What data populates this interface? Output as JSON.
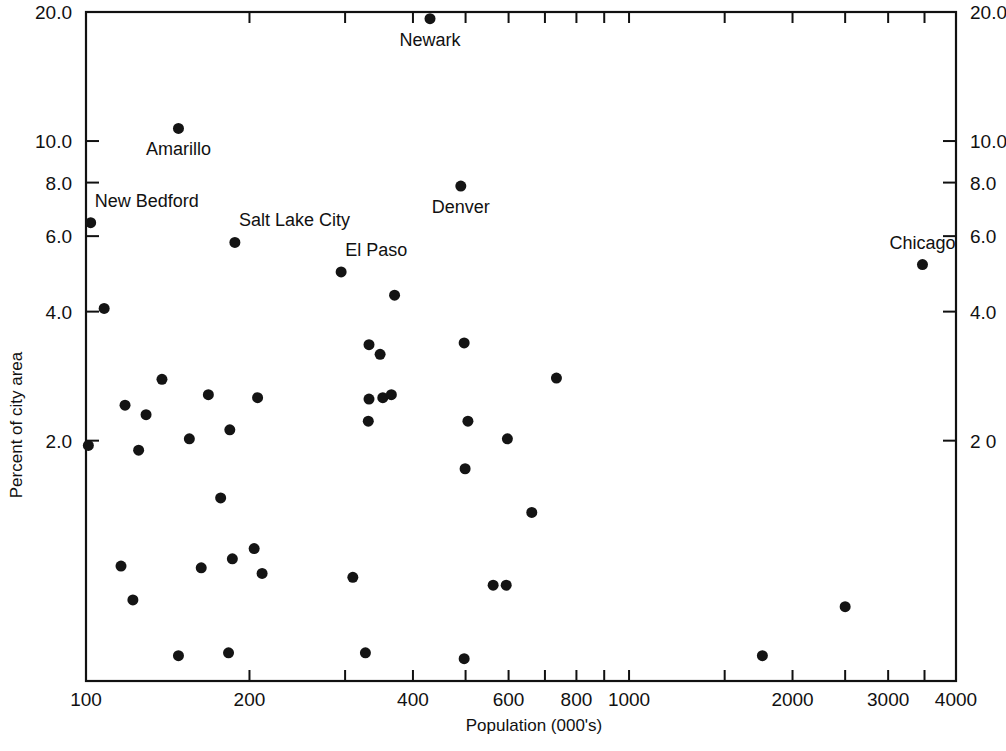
{
  "chart_data": {
    "type": "scatter",
    "title": "",
    "xlabel": "Population  (000's)",
    "ylabel": "Percent of city area",
    "xscale": "log",
    "yscale": "log",
    "xlim": [
      100,
      4000
    ],
    "ylim": [
      0.55,
      20.0
    ],
    "grid": false,
    "legend": "none",
    "xticks_labeled": [
      100,
      200,
      400,
      600,
      800,
      1000,
      2000,
      3000,
      4000
    ],
    "xtick_labels": [
      "100",
      "200",
      "400",
      "600",
      "800",
      "1000",
      "2000",
      "3000",
      "4000"
    ],
    "xticks_minor": [
      300,
      500,
      700,
      900,
      1500,
      2500,
      3500
    ],
    "yticks_labeled": [
      20.0,
      10.0,
      8.0,
      6.0,
      4.0,
      2.0
    ],
    "ytick_labels_left": [
      "20.0",
      "10.0",
      "8.0",
      "6.0",
      "4.0",
      "2.0"
    ],
    "ytick_labels_right": [
      "20.0",
      "10.0",
      "8.0",
      "6.0",
      "4.0",
      "2 0"
    ],
    "marker": "filled-circle",
    "marker_color": "#141414",
    "marker_size_px": 11,
    "points": [
      {
        "x": 430,
        "y": 19.3,
        "label": "Newark",
        "label_pos": "below"
      },
      {
        "x": 148,
        "y": 10.7,
        "label": "Amarillo",
        "label_pos": "below"
      },
      {
        "x": 490,
        "y": 7.85,
        "label": "Denver",
        "label_pos": "below"
      },
      {
        "x": 102,
        "y": 6.45,
        "label": "New Bedford",
        "label_pos": "above-right"
      },
      {
        "x": 188,
        "y": 5.8,
        "label": "Salt Lake City",
        "label_pos": "above-right"
      },
      {
        "x": 295,
        "y": 4.95,
        "label": "El Paso",
        "label_pos": "above-right"
      },
      {
        "x": 3470,
        "y": 5.15,
        "label": "Chicago",
        "label_pos": "above"
      },
      {
        "x": 108,
        "y": 4.07,
        "label": "",
        "label_pos": ""
      },
      {
        "x": 370,
        "y": 4.37,
        "label": "",
        "label_pos": ""
      },
      {
        "x": 332,
        "y": 3.35,
        "label": "",
        "label_pos": ""
      },
      {
        "x": 348,
        "y": 3.18,
        "label": "",
        "label_pos": ""
      },
      {
        "x": 497,
        "y": 3.38,
        "label": "",
        "label_pos": ""
      },
      {
        "x": 138,
        "y": 2.78,
        "label": "",
        "label_pos": ""
      },
      {
        "x": 168,
        "y": 2.56,
        "label": "",
        "label_pos": ""
      },
      {
        "x": 207,
        "y": 2.52,
        "label": "",
        "label_pos": ""
      },
      {
        "x": 352,
        "y": 2.52,
        "label": "",
        "label_pos": ""
      },
      {
        "x": 365,
        "y": 2.56,
        "label": "",
        "label_pos": ""
      },
      {
        "x": 332,
        "y": 2.5,
        "label": "",
        "label_pos": ""
      },
      {
        "x": 735,
        "y": 2.8,
        "label": "",
        "label_pos": ""
      },
      {
        "x": 118,
        "y": 2.42,
        "label": "",
        "label_pos": ""
      },
      {
        "x": 129,
        "y": 2.3,
        "label": "",
        "label_pos": ""
      },
      {
        "x": 184,
        "y": 2.12,
        "label": "",
        "label_pos": ""
      },
      {
        "x": 331,
        "y": 2.22,
        "label": "",
        "label_pos": ""
      },
      {
        "x": 505,
        "y": 2.22,
        "label": "",
        "label_pos": ""
      },
      {
        "x": 155,
        "y": 2.02,
        "label": "",
        "label_pos": ""
      },
      {
        "x": 597,
        "y": 2.02,
        "label": "",
        "label_pos": ""
      },
      {
        "x": 101,
        "y": 1.95,
        "label": "",
        "label_pos": ""
      },
      {
        "x": 125,
        "y": 1.9,
        "label": "",
        "label_pos": ""
      },
      {
        "x": 499,
        "y": 1.72,
        "label": "",
        "label_pos": ""
      },
      {
        "x": 177,
        "y": 1.47,
        "label": "",
        "label_pos": ""
      },
      {
        "x": 662,
        "y": 1.36,
        "label": "",
        "label_pos": ""
      },
      {
        "x": 116,
        "y": 1.02,
        "label": "",
        "label_pos": ""
      },
      {
        "x": 163,
        "y": 1.01,
        "label": "",
        "label_pos": ""
      },
      {
        "x": 186,
        "y": 1.06,
        "label": "",
        "label_pos": ""
      },
      {
        "x": 204,
        "y": 1.12,
        "label": "",
        "label_pos": ""
      },
      {
        "x": 310,
        "y": 0.96,
        "label": "",
        "label_pos": ""
      },
      {
        "x": 122,
        "y": 0.85,
        "label": "",
        "label_pos": ""
      },
      {
        "x": 211,
        "y": 0.98,
        "label": "",
        "label_pos": ""
      },
      {
        "x": 562,
        "y": 0.92,
        "label": "",
        "label_pos": ""
      },
      {
        "x": 594,
        "y": 0.92,
        "label": "",
        "label_pos": ""
      },
      {
        "x": 2500,
        "y": 0.82,
        "label": "",
        "label_pos": ""
      },
      {
        "x": 148,
        "y": 0.63,
        "label": "",
        "label_pos": ""
      },
      {
        "x": 183,
        "y": 0.64,
        "label": "",
        "label_pos": ""
      },
      {
        "x": 327,
        "y": 0.64,
        "label": "",
        "label_pos": ""
      },
      {
        "x": 497,
        "y": 0.62,
        "label": "",
        "label_pos": ""
      },
      {
        "x": 1760,
        "y": 0.63,
        "label": "",
        "label_pos": ""
      }
    ]
  },
  "axes": {
    "x_title": "Population  (000's)",
    "y_title": "Percent of city area"
  },
  "annotations": {
    "newark": "Newark",
    "amarillo": "Amarillo",
    "denver": "Denver",
    "new_bedford": "New  Bedford",
    "salt_lake_city": "Salt  Lake  City",
    "el_paso": "El  Paso",
    "chicago": "Chicago"
  },
  "colors": {
    "axis": "#111111",
    "marker": "#141414",
    "background": "#ffffff"
  }
}
